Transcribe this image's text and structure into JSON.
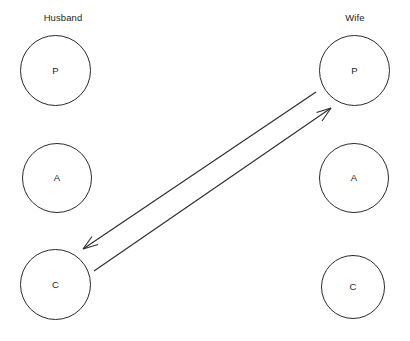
{
  "diagram": {
    "type": "transactional-analysis-crossed-transaction",
    "canvas": {
      "width": 410,
      "height": 341,
      "background": "#ffffff"
    },
    "stroke_color": "#2b2b2b",
    "text_color": "#1d1d1d",
    "columns": [
      {
        "id": "husband",
        "label": "Husband",
        "nodes": [
          {
            "id": "husband-p",
            "label": "P",
            "name": "Parent"
          },
          {
            "id": "husband-a",
            "label": "A",
            "name": "Adult"
          },
          {
            "id": "husband-c",
            "label": "C",
            "name": "Child"
          }
        ]
      },
      {
        "id": "wife",
        "label": "Wife",
        "nodes": [
          {
            "id": "wife-p",
            "label": "P",
            "name": "Parent"
          },
          {
            "id": "wife-a",
            "label": "A",
            "name": "Adult"
          },
          {
            "id": "wife-c",
            "label": "C",
            "name": "Child"
          }
        ]
      }
    ],
    "arrows": [
      {
        "id": "arrow-husband-c-to-wife-p",
        "from": "husband-c",
        "to": "wife-p",
        "direction": "up-right"
      },
      {
        "id": "arrow-wife-p-to-husband-c",
        "from": "wife-p",
        "to": "husband-c",
        "direction": "down-left"
      }
    ]
  }
}
